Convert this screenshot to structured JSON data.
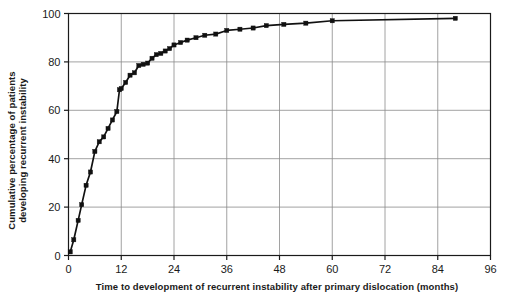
{
  "chart_data": {
    "type": "line",
    "title": "",
    "subtitle": "",
    "xlabel": "Time to development of recurrent instability after primary dislocation (months)",
    "ylabel": "Cumulative percentage of patients developing recurrent instability",
    "ylabel_line1": "Cumulative percentage of patients",
    "ylabel_line2": "developing recurrent instability",
    "xlim": [
      0,
      96
    ],
    "ylim": [
      0,
      100
    ],
    "xticks": [
      0,
      12,
      24,
      36,
      48,
      60,
      72,
      84,
      96
    ],
    "yticks": [
      0,
      20,
      40,
      60,
      80,
      100
    ],
    "grid": true,
    "grid_color": "#8a8a8a",
    "axis_color": "#1a1a1a",
    "legend": "none",
    "marker": "square",
    "marker_color": "#111111",
    "line_color": "#111111",
    "series": [
      {
        "name": "Cumulative incidence of recurrent instability",
        "x": [
          0.4,
          1.2,
          2.2,
          3.0,
          4.0,
          5.0,
          6.0,
          7.0,
          8.0,
          9.0,
          10.0,
          11.0,
          11.6,
          12.0,
          13.0,
          14.0,
          15.0,
          16.0,
          17.0,
          18.0,
          19.0,
          20.0,
          21.0,
          22.0,
          23.0,
          24.0,
          25.5,
          27.0,
          29.0,
          31.0,
          33.5,
          36.0,
          39.0,
          42.0,
          45.0,
          49.0,
          54.0,
          60.0,
          88.0
        ],
        "y": [
          1.5,
          6.5,
          14.5,
          21.0,
          29.0,
          34.5,
          43.0,
          47.0,
          49.0,
          52.5,
          56.0,
          59.5,
          68.5,
          69.0,
          71.5,
          74.5,
          75.5,
          78.5,
          79.0,
          79.5,
          81.5,
          83.0,
          83.5,
          84.5,
          85.5,
          87.0,
          88.0,
          89.0,
          90.0,
          91.0,
          91.5,
          93.0,
          93.5,
          94.0,
          95.0,
          95.5,
          96.0,
          97.0,
          98.0
        ]
      }
    ]
  }
}
